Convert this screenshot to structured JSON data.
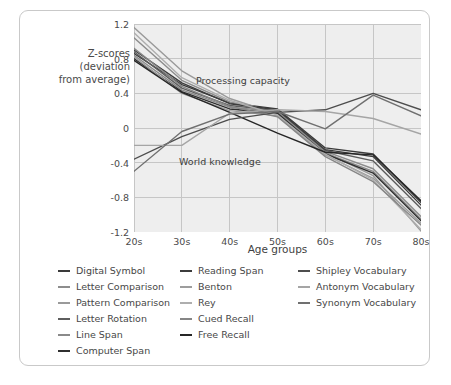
{
  "figure": {
    "y_axis_title": "Z-scores\n(deviation\nfrom average)",
    "x_axis_title": "Age groups",
    "annotations": {
      "processing": "Processing capacity",
      "world": "World knowledge"
    }
  },
  "colors": {
    "plot_background": "#eeeeee",
    "grid": "#c6c6c6",
    "card_border": "#c9c9c9",
    "text": "#4a4a4a"
  },
  "legend": {
    "columns": [
      {
        "items": [
          {
            "label": "Digital Symbol",
            "color": "#3a3a3a"
          },
          {
            "label": "Letter Comparison",
            "color": "#8d8d8d"
          },
          {
            "label": "Pattern Comparison",
            "color": "#9a9a9a"
          },
          {
            "label": "Letter Rotation",
            "color": "#5e5e5e"
          },
          {
            "label": "Line Span",
            "color": "#8a8a8a"
          },
          {
            "label": "Computer Span",
            "color": "#2f2f2f"
          }
        ]
      },
      {
        "items": [
          {
            "label": "Reading Span",
            "color": "#3c3c3c"
          },
          {
            "label": "Benton",
            "color": "#9d9d9d"
          },
          {
            "label": "Rey",
            "color": "#aeaeae"
          },
          {
            "label": "Cued Recall",
            "color": "#868686"
          },
          {
            "label": "Free Recall",
            "color": "#262626"
          }
        ]
      },
      {
        "items": [
          {
            "label": "Shipley Vocabulary",
            "color": "#4d4d4d"
          },
          {
            "label": "Antonym Vocabulary",
            "color": "#a5a5a5"
          },
          {
            "label": "Synonym Vocabulary",
            "color": "#707070"
          }
        ]
      }
    ]
  },
  "chart_data": {
    "type": "line",
    "title": "",
    "xlabel": "Age groups",
    "ylabel": "Z-scores (deviation from average)",
    "categories": [
      "20s",
      "30s",
      "40s",
      "50s",
      "60s",
      "70s",
      "80s"
    ],
    "x_tick_labels": [
      "20s",
      "30s",
      "40s",
      "50s",
      "60s",
      "70s",
      "80s"
    ],
    "y_tick_labels": [
      "1.2",
      "0.8",
      "0.4",
      "0",
      "-0.4",
      "-0.8",
      "-1.2"
    ],
    "y_ticks": [
      1.2,
      0.8,
      0.4,
      0,
      -0.4,
      -0.8,
      -1.2
    ],
    "ylim": [
      -1.2,
      1.2
    ],
    "grid": true,
    "legend_position": "below",
    "annotations": [
      {
        "text": "Processing capacity",
        "x": "40s",
        "y": 0.62
      },
      {
        "text": "World knowledge",
        "x": "35s",
        "y": -0.42
      }
    ],
    "series": [
      {
        "name": "Digital Symbol",
        "color": "#3a3a3a",
        "values": [
          0.86,
          0.5,
          0.29,
          0.22,
          -0.23,
          -0.3,
          -0.86
        ]
      },
      {
        "name": "Letter Comparison",
        "color": "#8d8d8d",
        "values": [
          1.04,
          0.55,
          0.3,
          0.18,
          -0.27,
          -0.47,
          -1.02
        ]
      },
      {
        "name": "Pattern Comparison",
        "color": "#9a9a9a",
        "values": [
          1.16,
          0.66,
          0.34,
          0.16,
          -0.28,
          -0.55,
          -1.19
        ]
      },
      {
        "name": "Letter Rotation",
        "color": "#5e5e5e",
        "values": [
          0.88,
          0.46,
          0.26,
          0.2,
          -0.26,
          -0.38,
          -0.93
        ]
      },
      {
        "name": "Line Span",
        "color": "#8a8a8a",
        "values": [
          0.84,
          0.44,
          0.24,
          0.19,
          -0.29,
          -0.5,
          -1.05
        ]
      },
      {
        "name": "Computer Span",
        "color": "#2f2f2f",
        "values": [
          0.8,
          0.42,
          0.22,
          0.17,
          -0.3,
          -0.52,
          -1.07
        ]
      },
      {
        "name": "Reading Span",
        "color": "#3c3c3c",
        "values": [
          0.9,
          0.52,
          0.28,
          0.21,
          -0.25,
          -0.33,
          -0.89
        ]
      },
      {
        "name": "Benton",
        "color": "#9d9d9d",
        "values": [
          0.82,
          0.4,
          0.2,
          0.14,
          -0.31,
          -0.58,
          -1.1
        ]
      },
      {
        "name": "Rey",
        "color": "#aeaeae",
        "values": [
          1.1,
          0.58,
          0.32,
          0.15,
          -0.3,
          -0.6,
          -1.17
        ]
      },
      {
        "name": "Cued Recall",
        "color": "#868686",
        "values": [
          0.92,
          0.48,
          0.25,
          0.13,
          -0.33,
          -0.62,
          -1.12
        ]
      },
      {
        "name": "Free Recall",
        "color": "#262626",
        "values": [
          0.78,
          0.41,
          0.18,
          -0.06,
          -0.28,
          -0.31,
          -0.84
        ]
      },
      {
        "name": "Shipley Vocabulary",
        "color": "#4d4d4d",
        "values": [
          -0.36,
          -0.1,
          0.1,
          0.18,
          0.21,
          0.4,
          0.21
        ]
      },
      {
        "name": "Antonym Vocabulary",
        "color": "#a5a5a5",
        "values": [
          -0.2,
          -0.2,
          0.17,
          0.21,
          0.19,
          0.11,
          -0.07
        ]
      },
      {
        "name": "Synonym Vocabulary",
        "color": "#707070",
        "values": [
          -0.5,
          -0.04,
          0.16,
          0.19,
          -0.01,
          0.38,
          0.14
        ]
      }
    ]
  }
}
